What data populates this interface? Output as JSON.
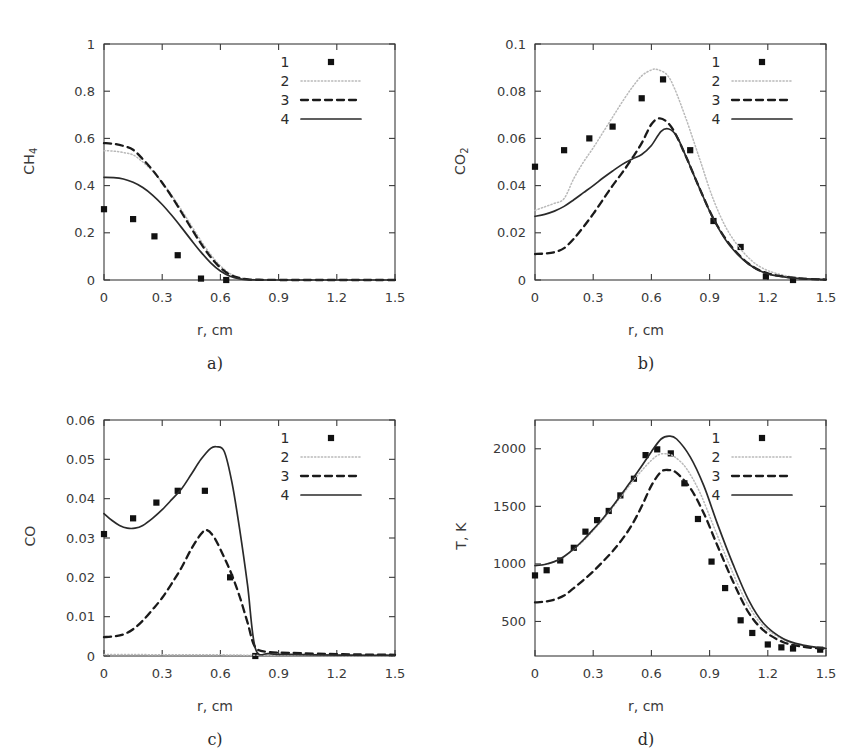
{
  "figure": {
    "panels": [
      "a",
      "b",
      "c",
      "d"
    ],
    "shared_xlabel": "r, cm",
    "legend_entries": [
      "1",
      "2",
      "3",
      "4"
    ],
    "legend_styles": [
      "marker-square",
      "dotted-line",
      "dashed-line",
      "solid-line"
    ],
    "colors": {
      "axis": "#3a3a3a",
      "marker": "#111111",
      "curve2_dotted": "#b9b9b9",
      "curve3_dashed": "#1a1a1a",
      "curve4_solid": "#2a2a2a"
    }
  },
  "captions": {
    "a": "a)",
    "b": "b)",
    "c": "c)",
    "d": "d)"
  },
  "chart_data": [
    {
      "panel": "a",
      "type": "scatter",
      "title": "",
      "xlabel": "r, cm",
      "ylabel": "CH4",
      "ylabel_base": "CH",
      "ylabel_sub": "4",
      "xlim": [
        0,
        1.5
      ],
      "ylim": [
        0,
        1
      ],
      "xticks": [
        0,
        0.3,
        0.6,
        0.9,
        1.2,
        1.5
      ],
      "xticklabels": [
        "0",
        "0.3",
        "0.6",
        "0.9",
        "1.2",
        "1.5"
      ],
      "yticks": [
        0,
        0.2,
        0.4,
        0.6,
        0.8,
        1
      ],
      "yticklabels": [
        "0",
        "0.2",
        "0.4",
        "0.6",
        "0.8",
        "1"
      ],
      "grid": false,
      "legend_position": "top-right",
      "series": [
        {
          "name": "1",
          "style": "marker-square",
          "x": [
            0.0,
            0.15,
            0.26,
            0.38,
            0.5,
            0.63
          ],
          "y": [
            0.3,
            0.258,
            0.185,
            0.105,
            0.006,
            0.0
          ]
        },
        {
          "name": "2",
          "style": "dotted-line",
          "x": [
            0.0,
            0.05,
            0.1,
            0.15,
            0.2,
            0.25,
            0.3,
            0.35,
            0.4,
            0.45,
            0.5,
            0.55,
            0.6,
            0.65,
            0.7,
            0.75,
            0.8,
            0.9,
            1.0,
            1.2,
            1.5
          ],
          "y": [
            0.548,
            0.546,
            0.54,
            0.53,
            0.5,
            0.462,
            0.413,
            0.358,
            0.296,
            0.231,
            0.166,
            0.108,
            0.06,
            0.027,
            0.01,
            0.003,
            0.001,
            0.0,
            0.0,
            0.0,
            0.0
          ]
        },
        {
          "name": "3",
          "style": "dashed-line",
          "x": [
            0.0,
            0.05,
            0.1,
            0.15,
            0.2,
            0.25,
            0.3,
            0.35,
            0.4,
            0.45,
            0.5,
            0.55,
            0.6,
            0.65,
            0.7,
            0.75,
            0.8,
            0.9,
            1.0,
            1.2,
            1.5
          ],
          "y": [
            0.58,
            0.577,
            0.568,
            0.552,
            0.512,
            0.466,
            0.412,
            0.352,
            0.286,
            0.219,
            0.154,
            0.097,
            0.052,
            0.022,
            0.008,
            0.002,
            0.001,
            0.0,
            0.0,
            0.0,
            0.0
          ]
        },
        {
          "name": "4",
          "style": "solid-line",
          "x": [
            0.0,
            0.05,
            0.1,
            0.15,
            0.2,
            0.25,
            0.3,
            0.35,
            0.4,
            0.45,
            0.5,
            0.55,
            0.6,
            0.65,
            0.7,
            0.75,
            0.8,
            0.9,
            1.0,
            1.2,
            1.5
          ],
          "y": [
            0.435,
            0.434,
            0.428,
            0.414,
            0.392,
            0.36,
            0.32,
            0.273,
            0.222,
            0.169,
            0.118,
            0.073,
            0.038,
            0.016,
            0.005,
            0.001,
            0.0,
            0.0,
            0.0,
            0.0,
            0.0
          ]
        }
      ]
    },
    {
      "panel": "b",
      "type": "scatter",
      "title": "",
      "xlabel": "r, cm",
      "ylabel": "CO2",
      "ylabel_base": "CO",
      "ylabel_sub": "2",
      "xlim": [
        0,
        1.5
      ],
      "ylim": [
        0,
        0.1
      ],
      "xticks": [
        0,
        0.3,
        0.6,
        0.9,
        1.2,
        1.5
      ],
      "xticklabels": [
        "0",
        "0.3",
        "0.6",
        "0.9",
        "1.2",
        "1.5"
      ],
      "yticks": [
        0,
        0.02,
        0.04,
        0.06,
        0.08,
        0.1
      ],
      "yticklabels": [
        "0",
        "0.02",
        "0.04",
        "0.06",
        "0.08",
        "0.1"
      ],
      "grid": false,
      "legend_position": "top-right",
      "series": [
        {
          "name": "1",
          "style": "marker-square",
          "x": [
            0.0,
            0.15,
            0.28,
            0.4,
            0.55,
            0.66,
            0.8,
            0.92,
            1.06,
            1.19,
            1.33
          ],
          "y": [
            0.048,
            0.055,
            0.06,
            0.065,
            0.077,
            0.085,
            0.055,
            0.025,
            0.014,
            0.0015,
            0.0
          ]
        },
        {
          "name": "2",
          "style": "dotted-line",
          "x": [
            0.0,
            0.05,
            0.1,
            0.15,
            0.2,
            0.25,
            0.3,
            0.35,
            0.4,
            0.45,
            0.5,
            0.55,
            0.6,
            0.63,
            0.68,
            0.72,
            0.78,
            0.85,
            0.92,
            1.0,
            1.1,
            1.2,
            1.35,
            1.5
          ],
          "y": [
            0.0295,
            0.031,
            0.0325,
            0.0345,
            0.043,
            0.05,
            0.056,
            0.0625,
            0.069,
            0.0755,
            0.0815,
            0.0865,
            0.089,
            0.0892,
            0.087,
            0.081,
            0.068,
            0.051,
            0.034,
            0.02,
            0.0095,
            0.004,
            0.001,
            0.0003
          ]
        },
        {
          "name": "3",
          "style": "dashed-line",
          "x": [
            0.0,
            0.05,
            0.1,
            0.15,
            0.2,
            0.25,
            0.3,
            0.35,
            0.4,
            0.45,
            0.5,
            0.55,
            0.6,
            0.64,
            0.68,
            0.72,
            0.78,
            0.85,
            0.92,
            1.0,
            1.1,
            1.2,
            1.35,
            1.5
          ],
          "y": [
            0.011,
            0.0112,
            0.0118,
            0.0135,
            0.0175,
            0.0225,
            0.028,
            0.034,
            0.04,
            0.0455,
            0.0515,
            0.058,
            0.066,
            0.0685,
            0.067,
            0.0625,
            0.052,
            0.0385,
            0.026,
            0.0155,
            0.007,
            0.0028,
            0.0008,
            0.0002
          ]
        },
        {
          "name": "4",
          "style": "solid-line",
          "x": [
            0.0,
            0.05,
            0.1,
            0.15,
            0.2,
            0.25,
            0.3,
            0.35,
            0.4,
            0.45,
            0.5,
            0.55,
            0.6,
            0.65,
            0.69,
            0.73,
            0.78,
            0.85,
            0.92,
            1.0,
            1.1,
            1.2,
            1.35,
            1.5
          ],
          "y": [
            0.027,
            0.0278,
            0.0292,
            0.0312,
            0.034,
            0.037,
            0.04,
            0.0432,
            0.0462,
            0.049,
            0.0512,
            0.0532,
            0.057,
            0.063,
            0.064,
            0.061,
            0.052,
            0.0385,
            0.0258,
            0.015,
            0.0068,
            0.0026,
            0.0007,
            0.0002
          ]
        }
      ]
    },
    {
      "panel": "c",
      "type": "scatter",
      "title": "",
      "xlabel": "r, cm",
      "ylabel": "CO",
      "ylabel_base": "CO",
      "ylabel_sub": "",
      "xlim": [
        0,
        1.5
      ],
      "ylim": [
        0,
        0.06
      ],
      "xticks": [
        0,
        0.3,
        0.6,
        0.9,
        1.2,
        1.5
      ],
      "xticklabels": [
        "0",
        "0.3",
        "0.6",
        "0.9",
        "1.2",
        "1.5"
      ],
      "yticks": [
        0,
        0.01,
        0.02,
        0.03,
        0.04,
        0.05,
        0.06
      ],
      "yticklabels": [
        "0",
        "0.01",
        "0.02",
        "0.03",
        "0.04",
        "0.05",
        "0.06"
      ],
      "grid": false,
      "legend_position": "top-right",
      "series": [
        {
          "name": "1",
          "style": "marker-square",
          "x": [
            0.0,
            0.15,
            0.27,
            0.38,
            0.52,
            0.65,
            0.78
          ],
          "y": [
            0.031,
            0.035,
            0.039,
            0.042,
            0.042,
            0.02,
            0.0
          ]
        },
        {
          "name": "2",
          "style": "dotted-line",
          "x": [
            0.0,
            0.15,
            0.3,
            0.45,
            0.6,
            0.75,
            0.9,
            1.05,
            1.2,
            1.35,
            1.5
          ],
          "y": [
            0.0004,
            0.0004,
            0.0003,
            0.0003,
            0.0003,
            0.0002,
            0.0002,
            0.0002,
            0.0001,
            0.0001,
            0.0001
          ]
        },
        {
          "name": "3",
          "style": "dashed-line",
          "x": [
            0.0,
            0.05,
            0.1,
            0.15,
            0.2,
            0.25,
            0.3,
            0.35,
            0.4,
            0.45,
            0.5,
            0.53,
            0.57,
            0.62,
            0.66,
            0.7,
            0.74,
            0.78,
            0.85,
            0.95,
            1.1,
            1.3,
            1.5
          ],
          "y": [
            0.0048,
            0.005,
            0.0055,
            0.0068,
            0.009,
            0.0118,
            0.0148,
            0.0185,
            0.0225,
            0.0272,
            0.031,
            0.032,
            0.03,
            0.025,
            0.0205,
            0.015,
            0.0085,
            0.0022,
            0.001,
            0.0008,
            0.0006,
            0.0004,
            0.0003
          ]
        },
        {
          "name": "4",
          "style": "solid-line",
          "x": [
            0.0,
            0.04,
            0.08,
            0.12,
            0.16,
            0.2,
            0.25,
            0.3,
            0.35,
            0.4,
            0.45,
            0.5,
            0.55,
            0.58,
            0.62,
            0.66,
            0.7,
            0.74,
            0.78,
            0.85,
            0.95,
            1.1,
            1.3,
            1.5
          ],
          "y": [
            0.0362,
            0.0345,
            0.0332,
            0.0325,
            0.0325,
            0.0332,
            0.035,
            0.0372,
            0.0398,
            0.0425,
            0.0462,
            0.05,
            0.0528,
            0.0532,
            0.052,
            0.044,
            0.032,
            0.018,
            0.002,
            0.0006,
            0.0004,
            0.0003,
            0.0002,
            0.0002
          ]
        }
      ]
    },
    {
      "panel": "d",
      "type": "scatter",
      "title": "",
      "xlabel": "r, cm",
      "ylabel": "T, K",
      "ylabel_base": "T, K",
      "ylabel_sub": "",
      "xlim": [
        0,
        1.5
      ],
      "ylim": [
        200,
        2250
      ],
      "xticks": [
        0,
        0.3,
        0.6,
        0.9,
        1.2,
        1.5
      ],
      "xticklabels": [
        "0",
        "0.3",
        "0.6",
        "0.9",
        "1.2",
        "1.5"
      ],
      "yticks": [
        500,
        1000,
        1500,
        2000
      ],
      "yticklabels": [
        "500",
        "1000",
        "1500",
        "2000"
      ],
      "grid": false,
      "legend_position": "top-right",
      "series": [
        {
          "name": "1",
          "style": "marker-square",
          "x": [
            0.0,
            0.06,
            0.13,
            0.2,
            0.26,
            0.32,
            0.38,
            0.44,
            0.51,
            0.57,
            0.63,
            0.7,
            0.77,
            0.84,
            0.91,
            0.98,
            1.06,
            1.12,
            1.2,
            1.27,
            1.33,
            1.47
          ],
          "y": [
            900,
            945,
            1030,
            1140,
            1280,
            1380,
            1460,
            1595,
            1740,
            1945,
            1995,
            1960,
            1700,
            1390,
            1020,
            790,
            510,
            400,
            300,
            275,
            265,
            255
          ]
        },
        {
          "name": "2",
          "style": "dotted-line",
          "x": [
            0.0,
            0.05,
            0.1,
            0.15,
            0.2,
            0.25,
            0.3,
            0.35,
            0.4,
            0.45,
            0.5,
            0.55,
            0.6,
            0.64,
            0.68,
            0.72,
            0.78,
            0.85,
            0.92,
            1.0,
            1.08,
            1.16,
            1.25,
            1.35,
            1.5
          ],
          "y": [
            985,
            995,
            1020,
            1065,
            1125,
            1200,
            1290,
            1385,
            1490,
            1600,
            1710,
            1810,
            1900,
            1950,
            1955,
            1930,
            1830,
            1620,
            1330,
            1000,
            700,
            490,
            370,
            300,
            265
          ]
        },
        {
          "name": "3",
          "style": "dashed-line",
          "x": [
            0.0,
            0.05,
            0.1,
            0.15,
            0.2,
            0.25,
            0.3,
            0.35,
            0.4,
            0.45,
            0.5,
            0.55,
            0.6,
            0.65,
            0.69,
            0.73,
            0.8,
            0.87,
            0.94,
            1.02,
            1.1,
            1.18,
            1.28,
            1.38,
            1.5
          ],
          "y": [
            665,
            672,
            690,
            725,
            790,
            860,
            935,
            1020,
            1110,
            1215,
            1340,
            1500,
            1680,
            1800,
            1815,
            1790,
            1660,
            1440,
            1160,
            850,
            580,
            420,
            320,
            280,
            262
          ]
        },
        {
          "name": "4",
          "style": "solid-line",
          "x": [
            0.0,
            0.05,
            0.1,
            0.15,
            0.2,
            0.25,
            0.3,
            0.35,
            0.4,
            0.45,
            0.5,
            0.55,
            0.6,
            0.65,
            0.69,
            0.73,
            0.8,
            0.87,
            0.94,
            1.02,
            1.1,
            1.18,
            1.28,
            1.38,
            1.5
          ],
          "y": [
            985,
            995,
            1020,
            1065,
            1130,
            1210,
            1300,
            1395,
            1500,
            1615,
            1730,
            1850,
            1975,
            2085,
            2110,
            2085,
            1930,
            1680,
            1350,
            1000,
            690,
            480,
            350,
            295,
            265
          ]
        }
      ]
    }
  ]
}
